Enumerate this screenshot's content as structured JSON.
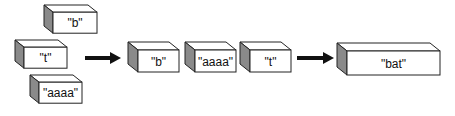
{
  "diagram": {
    "input_boxes": [
      {
        "label": "\"b\"",
        "x": 44,
        "y": 5,
        "w": 44,
        "h": 21,
        "depth": 9
      },
      {
        "label": "\"t\"",
        "x": 15,
        "y": 40,
        "w": 43,
        "h": 21,
        "depth": 9
      },
      {
        "label": "\"aaaa\"",
        "x": 30,
        "y": 75,
        "w": 43,
        "h": 21,
        "depth": 9
      }
    ],
    "arrows": [
      {
        "x1": 85,
        "x2": 121,
        "y": 58
      },
      {
        "x1": 297,
        "x2": 334,
        "y": 58
      }
    ],
    "ordered_boxes": [
      {
        "label": "\"b\"",
        "x": 128,
        "y": 42,
        "w": 41,
        "h": 22,
        "depth": 10
      },
      {
        "label": "\"aaaa\"",
        "x": 185,
        "y": 42,
        "w": 41,
        "h": 22,
        "depth": 10
      },
      {
        "label": "\"t\"",
        "x": 240,
        "y": 42,
        "w": 41,
        "h": 22,
        "depth": 10
      }
    ],
    "result_box": {
      "label": "\"bat\"",
      "x": 337,
      "y": 43,
      "w": 93,
      "h": 24,
      "depth": 10
    },
    "colors": {
      "front": "#ffffff",
      "top": "#ffffff",
      "side": "#8a8a8a",
      "stroke": "#222222",
      "arrow": "#111111"
    }
  }
}
